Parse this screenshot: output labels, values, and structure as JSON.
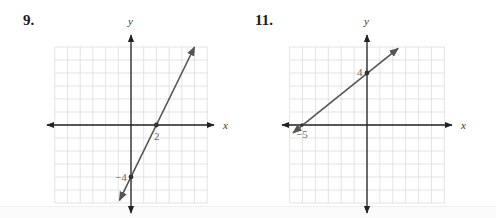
{
  "problems": [
    {
      "number": "9.",
      "x_axis_label": "x",
      "y_axis_label": "y",
      "point_labels": [
        "2",
        "−4"
      ],
      "line_equation_implied": "y = 2x - 4",
      "points": [
        {
          "x": 2,
          "y": 0,
          "label": "2"
        },
        {
          "x": 0,
          "y": -4,
          "label": "−4"
        }
      ]
    },
    {
      "number": "11.",
      "x_axis_label": "x",
      "y_axis_label": "y",
      "point_labels": [
        "4",
        "−5"
      ],
      "line_equation_implied": "y = 0.8x + 4",
      "points": [
        {
          "x": 0,
          "y": 4,
          "label": "4"
        },
        {
          "x": -5,
          "y": 0,
          "label": "−5"
        }
      ]
    }
  ],
  "chart_data": [
    {
      "type": "line",
      "title": "9.",
      "xlabel": "x",
      "ylabel": "y",
      "xlim": [
        -6,
        6
      ],
      "ylim": [
        -6,
        6
      ],
      "grid": true,
      "series": [
        {
          "name": "line",
          "x": [
            -0.9,
            5
          ],
          "y": [
            -5.8,
            6
          ]
        }
      ],
      "marked_points": [
        {
          "x": 2,
          "y": 0,
          "label": "2"
        },
        {
          "x": 0,
          "y": -4,
          "label": "−4"
        }
      ]
    },
    {
      "type": "line",
      "title": "11.",
      "xlabel": "x",
      "ylabel": "y",
      "xlim": [
        -6,
        6
      ],
      "ylim": [
        -6,
        6
      ],
      "grid": true,
      "series": [
        {
          "name": "line",
          "x": [
            -5.7,
            2.4
          ],
          "y": [
            -0.6,
            5.9
          ]
        }
      ],
      "marked_points": [
        {
          "x": 0,
          "y": 4,
          "label": "4"
        },
        {
          "x": -5,
          "y": 0,
          "label": "−5"
        }
      ]
    }
  ]
}
